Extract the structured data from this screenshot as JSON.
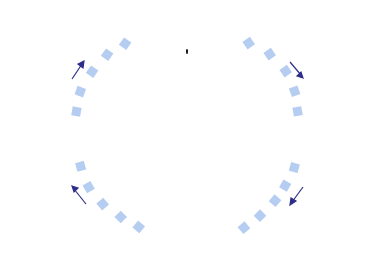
{
  "title": {
    "line1": "Leercyclus",
    "line2": "van Kolb"
  },
  "stages": {
    "top": {
      "main": "Concreet ervaren",
      "sub": "(Voelen)"
    },
    "right": {
      "main_line1": "Observeren en",
      "main_line2": "interpreteren",
      "sub": "(Waarnemen)"
    },
    "bottom": {
      "main_line1": "Begrijpen en",
      "main_line2": "abstraheren",
      "sub": "(Denken)"
    },
    "left": {
      "main_line1": "Actief",
      "main_line2": "experimenteren",
      "sub": "(Doen)"
    }
  },
  "axes": {
    "horizontal_left": "Hoe we de",
    "horizontal_right": "dingen doen",
    "vertical": "Hoe we over dingen denken"
  },
  "colors": {
    "cycle_dots": "#a9c4f0",
    "cycle_arrows": "#2e2e8a",
    "box_border": "#8a8a95",
    "axis_arrows": "#111111"
  }
}
